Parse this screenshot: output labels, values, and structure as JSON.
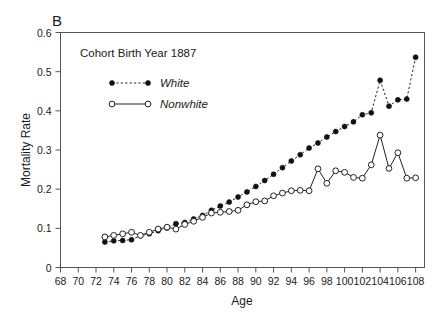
{
  "figure": {
    "panel_letter": "B",
    "background_color": "#ffffff",
    "foreground_color": "#1a1a1a"
  },
  "chart_data": {
    "type": "line",
    "title": "Cohort Birth Year 1887",
    "xlabel": "Age",
    "ylabel": "Mortality Rate",
    "xlim": [
      68,
      109
    ],
    "ylim": [
      0,
      0.6
    ],
    "grid": false,
    "legend_position": "upper-left-inside",
    "xticks": [
      68,
      70,
      72,
      74,
      76,
      78,
      80,
      82,
      84,
      86,
      88,
      90,
      92,
      94,
      96,
      98,
      100,
      102,
      104,
      106,
      108
    ],
    "xtick_labels": [
      "68",
      "70",
      "72",
      "74",
      "76",
      "78",
      "80",
      "82",
      "84",
      "86",
      "88",
      "90",
      "92",
      "94",
      "96",
      "98",
      "100",
      "102",
      "104",
      "106",
      "108"
    ],
    "yticks": [
      0,
      0.1,
      0.2,
      0.3,
      0.4,
      0.5,
      0.6
    ],
    "ytick_labels": [
      "0",
      "0.1",
      "0.2",
      "0.3",
      "0.4",
      "0.5",
      "0.6"
    ],
    "series": [
      {
        "name": "White",
        "marker": "filled-circle",
        "line_style": "dotted",
        "color": "#111111",
        "x": [
          73,
          74,
          75,
          76,
          77,
          78,
          79,
          80,
          81,
          82,
          83,
          84,
          85,
          86,
          87,
          88,
          89,
          90,
          91,
          92,
          93,
          94,
          95,
          96,
          97,
          98,
          99,
          100,
          101,
          102,
          103,
          104,
          105,
          106,
          107,
          108
        ],
        "values": [
          0.065,
          0.068,
          0.069,
          0.071,
          0.081,
          0.086,
          0.094,
          0.101,
          0.112,
          0.115,
          0.124,
          0.133,
          0.146,
          0.157,
          0.167,
          0.18,
          0.193,
          0.207,
          0.222,
          0.238,
          0.255,
          0.272,
          0.288,
          0.305,
          0.318,
          0.333,
          0.347,
          0.36,
          0.372,
          0.39,
          0.395,
          0.478,
          0.412,
          0.428,
          0.43,
          0.537
        ]
      },
      {
        "name": "Nonwhite",
        "marker": "open-circle",
        "line_style": "solid",
        "color": "#222222",
        "x": [
          73,
          74,
          75,
          76,
          77,
          78,
          79,
          80,
          81,
          82,
          83,
          84,
          85,
          86,
          87,
          88,
          89,
          90,
          91,
          92,
          93,
          94,
          95,
          96,
          97,
          98,
          99,
          100,
          101,
          102,
          103,
          104,
          105,
          106,
          107,
          108
        ],
        "values": [
          0.078,
          0.082,
          0.086,
          0.09,
          0.082,
          0.09,
          0.098,
          0.103,
          0.098,
          0.11,
          0.118,
          0.128,
          0.139,
          0.141,
          0.143,
          0.146,
          0.16,
          0.168,
          0.17,
          0.183,
          0.19,
          0.196,
          0.197,
          0.196,
          0.252,
          0.215,
          0.247,
          0.243,
          0.23,
          0.228,
          0.262,
          0.338,
          0.253,
          0.293,
          0.228,
          0.229
        ]
      }
    ],
    "legend": [
      {
        "label": "White",
        "marker": "filled-circle",
        "line_style": "dotted"
      },
      {
        "label": "Nonwhite",
        "marker": "open-circle",
        "line_style": "solid"
      }
    ]
  }
}
